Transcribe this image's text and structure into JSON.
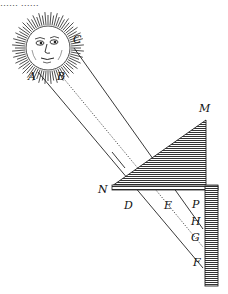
{
  "figure": {
    "top_text_cut": "…… ……",
    "labels": {
      "A": "A",
      "B": "B",
      "C": "C",
      "M": "M",
      "N": "N",
      "D": "D",
      "E": "E",
      "P": "P",
      "H": "H",
      "G": "G",
      "F": "F"
    },
    "colors": {
      "ink": "#111111",
      "hatch": "#444444",
      "background": "#ffffff"
    }
  }
}
